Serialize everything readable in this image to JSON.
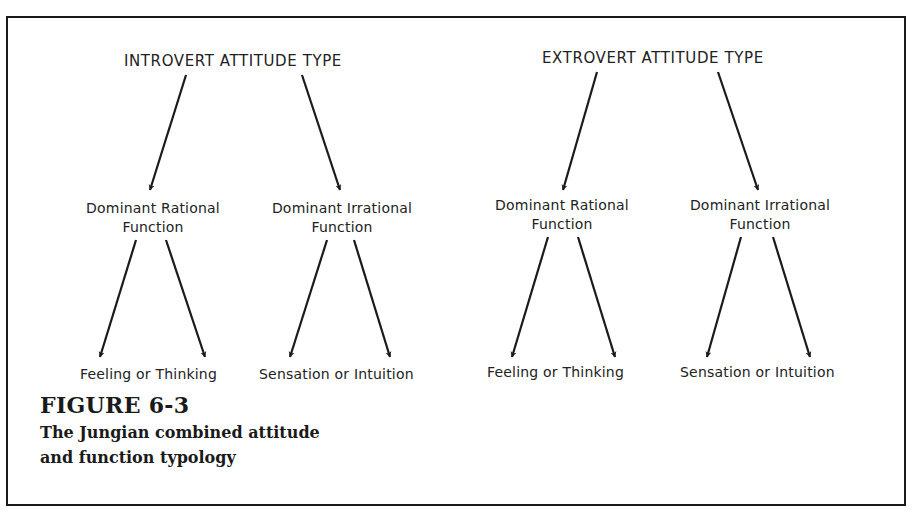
{
  "figure": {
    "number_label": "FIGURE 6-3",
    "caption_lines": [
      "The Jungian combined attitude",
      "and function typology"
    ]
  },
  "diagram": {
    "introvert": {
      "header": "INTROVERT ATTITUDE TYPE",
      "rational": {
        "line1": "Dominant Rational",
        "line2": "Function",
        "outcome": "Feeling or Thinking"
      },
      "irrational": {
        "line1": "Dominant Irrational",
        "line2": "Function",
        "outcome": "Sensation or Intuition"
      }
    },
    "extrovert": {
      "header": "EXTROVERT ATTITUDE TYPE",
      "rational": {
        "line1": "Dominant Rational",
        "line2": "Function",
        "outcome": "Feeling or Thinking"
      },
      "irrational": {
        "line1": "Dominant Irrational",
        "line2": "Function",
        "outcome": "Sensation or Intuition"
      }
    },
    "colors": {
      "ink": "#1a1a1a",
      "background": "#ffffff"
    }
  }
}
